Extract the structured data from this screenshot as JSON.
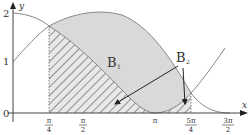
{
  "diagram": {
    "axes": {
      "x_label": "x",
      "y_label": "y",
      "y_ticks": [
        "0",
        "1",
        "2"
      ],
      "x_ticks": [
        {
          "num": "π",
          "den": "4"
        },
        {
          "num": "π",
          "den": "2"
        },
        {
          "num": "π",
          "den": ""
        },
        {
          "num": "5π",
          "den": "4"
        },
        {
          "num": "3π",
          "den": "2"
        }
      ]
    },
    "regions": {
      "b1_label": "B",
      "b1_sub": "1",
      "b2_label": "B",
      "b2_sub": "2"
    },
    "colors": {
      "shade": "#d9d9d9",
      "curve": "#888888",
      "axis": "#444444",
      "hatch": "#555555"
    }
  }
}
